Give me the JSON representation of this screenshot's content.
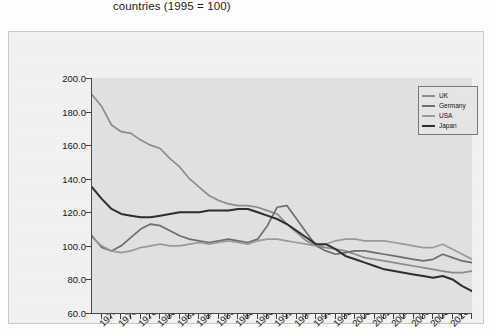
{
  "title": "countries (1995 = 100)",
  "legend": {
    "position": "top-right",
    "items": [
      {
        "label": "UK",
        "color": "#8c8c8c"
      },
      {
        "label": "Germany",
        "color": "#6e6e6e"
      },
      {
        "label": "USA",
        "color": "#9a9a9a"
      },
      {
        "label": "Japan",
        "color": "#2e2e2e"
      }
    ]
  },
  "axes": {
    "y_ticks": [
      "200.0",
      "180.0",
      "160.0",
      "140.0",
      "120.0",
      "100.0",
      "80.0",
      "60.0"
    ],
    "x_ticks": [
      "1974",
      "1976",
      "1978",
      "1980",
      "1982",
      "1984",
      "1986",
      "1988",
      "1990",
      "1992",
      "1994",
      "1996",
      "1998",
      "2000",
      "2002",
      "2004",
      "2006",
      "2008",
      "2010"
    ]
  },
  "chart_data": {
    "type": "line",
    "title": "countries (1995 = 100)",
    "xlabel": "",
    "ylabel": "",
    "ylim": [
      60,
      200
    ],
    "xlim": [
      1973,
      2012
    ],
    "grid": false,
    "legend_position": "top-right",
    "x": [
      1973,
      1974,
      1975,
      1976,
      1977,
      1978,
      1979,
      1980,
      1981,
      1982,
      1983,
      1984,
      1985,
      1986,
      1987,
      1988,
      1989,
      1990,
      1991,
      1992,
      1993,
      1994,
      1995,
      1996,
      1997,
      1998,
      1999,
      2000,
      2001,
      2002,
      2003,
      2004,
      2005,
      2006,
      2007,
      2008,
      2009,
      2010,
      2011,
      2012
    ],
    "series": [
      {
        "name": "UK",
        "color": "#8c8c8c",
        "values": [
          190,
          183,
          172,
          168,
          167,
          163,
          160,
          158,
          152,
          147,
          140,
          135,
          130,
          127,
          125,
          124,
          124,
          123,
          121,
          119,
          113,
          108,
          103,
          100,
          99,
          98,
          97,
          95,
          93,
          92,
          91,
          90,
          89,
          88,
          87,
          86,
          85,
          84,
          84,
          85
        ]
      },
      {
        "name": "Germany",
        "color": "#6e6e6e",
        "values": [
          106,
          99,
          97,
          100,
          105,
          110,
          113,
          112,
          109,
          106,
          104,
          103,
          102,
          103,
          104,
          103,
          102,
          104,
          112,
          123,
          124,
          116,
          108,
          100,
          97,
          95,
          96,
          97,
          97,
          96,
          95,
          94,
          93,
          92,
          91,
          92,
          95,
          93,
          91,
          90
        ]
      },
      {
        "name": "USA",
        "color": "#9a9a9a",
        "values": [
          105,
          100,
          97,
          96,
          97,
          99,
          100,
          101,
          100,
          100,
          101,
          102,
          101,
          102,
          103,
          102,
          101,
          103,
          104,
          104,
          103,
          102,
          101,
          100,
          101,
          103,
          104,
          104,
          103,
          103,
          103,
          102,
          101,
          100,
          99,
          99,
          101,
          98,
          95,
          92
        ]
      },
      {
        "name": "Japan",
        "color": "#2e2e2e",
        "values": [
          135,
          128,
          122,
          119,
          118,
          117,
          117,
          118,
          119,
          120,
          120,
          120,
          121,
          121,
          121,
          122,
          122,
          120,
          118,
          116,
          113,
          109,
          105,
          101,
          101,
          98,
          94,
          92,
          90,
          88,
          86,
          85,
          84,
          83,
          82,
          81,
          82,
          80,
          76,
          73
        ]
      }
    ]
  }
}
